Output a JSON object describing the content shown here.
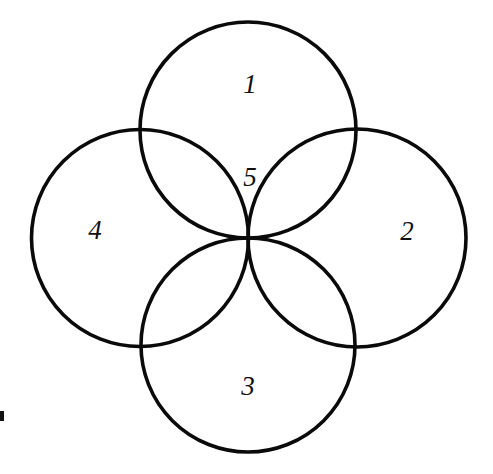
{
  "figure": {
    "type": "diagram",
    "kind": "four-overlapping-circles",
    "canvas": {
      "width": 493,
      "height": 474
    },
    "background_color": "#ffffff",
    "stroke_color": "#0a0a0a",
    "stroke_width": 3.6,
    "label_color": "#101010",
    "common_intersection_point": {
      "x": 248,
      "y": 238
    },
    "circles": [
      {
        "id": "circle-top",
        "label": "1",
        "cx": 248,
        "cy": 130,
        "r": 108.0
      },
      {
        "id": "circle-right",
        "label": "2",
        "cx": 357,
        "cy": 238,
        "r": 109.0
      },
      {
        "id": "circle-bottom",
        "label": "3",
        "cx": 248,
        "cy": 345,
        "r": 107.0
      },
      {
        "id": "circle-left",
        "label": "4",
        "cx": 140,
        "cy": 238,
        "r": 108.5
      }
    ],
    "labels": [
      {
        "id": "label-1",
        "text": "1",
        "x": 250,
        "y": 87,
        "region": "top-circle-only"
      },
      {
        "id": "label-2",
        "text": "2",
        "x": 407,
        "y": 234,
        "region": "right-circle-only"
      },
      {
        "id": "label-3",
        "text": "3",
        "x": 248,
        "y": 389,
        "region": "bottom-circle-only"
      },
      {
        "id": "label-4",
        "text": "4",
        "x": 95,
        "y": 233,
        "region": "left-circle-only"
      },
      {
        "id": "label-5",
        "text": "5",
        "x": 250,
        "y": 180,
        "region": "central-overlap"
      }
    ],
    "artifact": {
      "id": "scan-artifact",
      "x": 0,
      "y": 411,
      "width": 4,
      "height": 10
    }
  }
}
